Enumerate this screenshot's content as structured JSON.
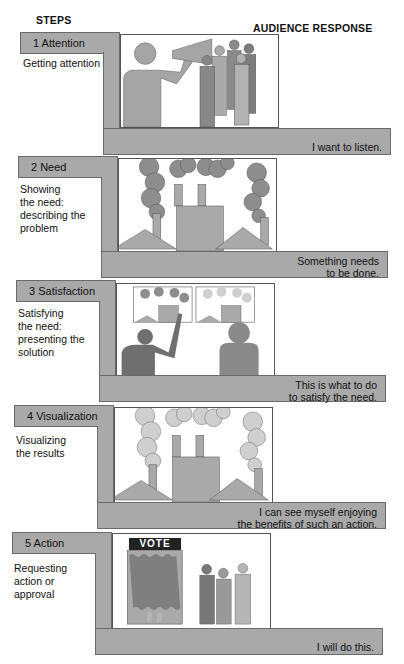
{
  "headers": {
    "left": "STEPS",
    "right": "AUDIENCE RESPONSE"
  },
  "colors": {
    "bar_fill": "#a9a9a9",
    "bar_border": "#6a6a6a",
    "figure_dark": "#7a7a7a",
    "figure_mid": "#999999",
    "figure_light": "#b5b5b5",
    "smoke_light": "#cfcfcf"
  },
  "steps": [
    {
      "label": "1 Attention",
      "description": "Getting attention",
      "response": "I want to listen.",
      "image": "speaker-with-megaphone-and-crowd"
    },
    {
      "label": "2 Need",
      "description": "Showing\nthe need:\ndescribing the\nproblem",
      "response": "Something needs\nto be done.",
      "image": "polluting-factory-dark-smoke"
    },
    {
      "label": "3 Satisfaction",
      "description": "Satisfying\nthe need:\npresenting the\nsolution",
      "response": "This is what to do\nto satisfy the need.",
      "image": "presenter-pointing-at-before-after-charts"
    },
    {
      "label": "4 Visualization",
      "description": "Visualizing\nthe results",
      "response": "I can see myself enjoying\nthe benefits of such an action.",
      "image": "factory-light-smoke"
    },
    {
      "label": "5 Action",
      "description": "Requesting\naction or\napproval",
      "response": "I will do this.",
      "image": "voting-booth-with-people"
    }
  ],
  "vote_sign": "VOTE"
}
